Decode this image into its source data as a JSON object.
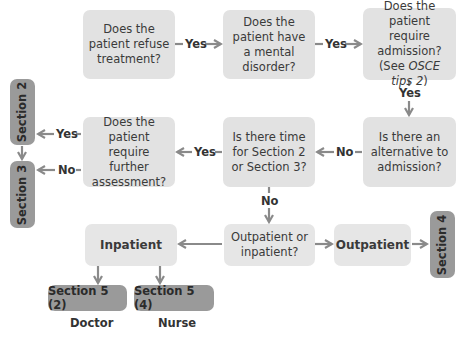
{
  "diagram": {
    "nodes": {
      "refuse": {
        "lines": [
          "Does the",
          "patient refuse",
          "treatment?"
        ]
      },
      "mental": {
        "lines": [
          "Does the",
          "patient have",
          "a mental",
          "disorder?"
        ]
      },
      "admission": {
        "lines": [
          "Does the",
          "patient require",
          "admission?"
        ],
        "note_prefix": "(See ",
        "note_italic": "OSCE tips 2",
        "note_suffix": ")"
      },
      "alternative": {
        "lines": [
          "Is there an",
          "alternative to",
          "admission?"
        ]
      },
      "time": {
        "lines": [
          "Is there time",
          "for Section 2",
          "or Section 3?"
        ]
      },
      "assessment": {
        "lines": [
          "Does the",
          "patient",
          "require further",
          "assessment?"
        ]
      },
      "outin": {
        "lines": [
          "Outpatient or",
          "inpatient?"
        ]
      },
      "inpatient": {
        "label": "Inpatient"
      },
      "outpatient": {
        "label": "Outpatient"
      },
      "section2": {
        "label": "Section 2"
      },
      "section3": {
        "label": "Section 3"
      },
      "section4": {
        "label": "Section 4"
      },
      "section5_2": {
        "label": "Section 5 (2)",
        "caption": "Doctor"
      },
      "section5_4": {
        "label": "Section 5 (4)",
        "caption": "Nurse"
      }
    },
    "edge_labels": {
      "refuse_to_mental": "Yes",
      "mental_to_admission": "Yes",
      "admission_to_alternative": "Yes",
      "alternative_to_time": "No",
      "time_to_assessment": "Yes",
      "assessment_to_section2": "Yes",
      "assessment_to_section3": "No",
      "time_to_outin": "No"
    },
    "colors": {
      "question_box": "#e2e2e2",
      "section_pill": "#9a9a9a",
      "arrow": "#8a8a8a",
      "text": "#3a3a3a"
    }
  }
}
